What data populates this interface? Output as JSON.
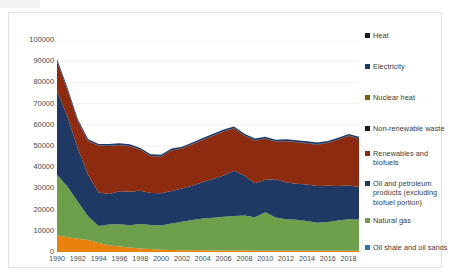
{
  "chart_data": {
    "type": "area",
    "stacked": true,
    "title": "",
    "subtitle": "",
    "xlabel": "",
    "ylabel": "",
    "grid": true,
    "legend_position": "right",
    "xlim": [
      1990,
      2019
    ],
    "ylim": [
      0,
      100000
    ],
    "y_ticks": [
      "0",
      "10000",
      "20000",
      "30000",
      "40000",
      "50000",
      "60000",
      "70000",
      "80000",
      "90000",
      "100000"
    ],
    "x_ticks": [
      "1990",
      "1992",
      "1994",
      "1996",
      "1998",
      "2000",
      "2002",
      "2004",
      "2006",
      "2008",
      "2010",
      "2012",
      "2014",
      "2016",
      "2018"
    ],
    "x": [
      1990,
      1991,
      1992,
      1993,
      1994,
      1995,
      1996,
      1997,
      1998,
      1999,
      2000,
      2001,
      2002,
      2003,
      2004,
      2005,
      2006,
      2007,
      2008,
      2009,
      2010,
      2011,
      2012,
      2013,
      2014,
      2015,
      2016,
      2017,
      2018,
      2019
    ],
    "series": [
      {
        "name": "Oil shale and oil sands",
        "color": "#E8820C",
        "values": [
          7900,
          6900,
          6200,
          5700,
          4300,
          3200,
          2600,
          2100,
          1700,
          1400,
          1100,
          900,
          800,
          800,
          800,
          700,
          700,
          700,
          700,
          600,
          600,
          600,
          600,
          600,
          600,
          600,
          600,
          600,
          600,
          600
        ]
      },
      {
        "name": "Natural gas",
        "color": "#6E9F4B",
        "values": [
          28500,
          24000,
          17500,
          11000,
          8000,
          9800,
          10500,
          10500,
          11500,
          11300,
          11400,
          12600,
          13500,
          14300,
          15000,
          15400,
          15900,
          16300,
          16500,
          15800,
          18100,
          15700,
          14800,
          14600,
          14000,
          13200,
          13600,
          14200,
          14900,
          14700
        ]
      },
      {
        "name": "Oil and petroleum products (excluding biofuel portion)",
        "color": "#1F3864",
        "values": [
          39500,
          33000,
          25000,
          19500,
          15800,
          14400,
          15500,
          15800,
          15700,
          15100,
          15200,
          15300,
          15600,
          16200,
          17200,
          18300,
          19500,
          21300,
          18900,
          16000,
          15400,
          18000,
          17400,
          17000,
          17200,
          17300,
          17000,
          16300,
          15900,
          15400
        ]
      },
      {
        "name": "Renewables and biofuels",
        "color": "#8C2B10",
        "values": [
          13800,
          12500,
          12800,
          16000,
          22000,
          22600,
          21800,
          21500,
          19300,
          17400,
          17300,
          19100,
          18900,
          19400,
          19800,
          20400,
          20700,
          19900,
          18700,
          20100,
          19300,
          17700,
          19400,
          19500,
          19400,
          19500,
          20200,
          21800,
          23300,
          22700
        ]
      },
      {
        "name": "Non-renewable waste",
        "color": "#1A1A1A",
        "values": [
          100,
          100,
          100,
          100,
          100,
          100,
          100,
          100,
          100,
          100,
          100,
          100,
          100,
          200,
          200,
          200,
          200,
          200,
          200,
          200,
          200,
          200,
          200,
          200,
          200,
          200,
          200,
          200,
          200,
          200
        ]
      },
      {
        "name": "Nuclear heat",
        "color": "#7F6000",
        "values": [
          0,
          0,
          0,
          0,
          0,
          0,
          0,
          0,
          0,
          0,
          0,
          0,
          0,
          0,
          0,
          0,
          0,
          0,
          0,
          0,
          0,
          0,
          0,
          0,
          0,
          0,
          0,
          0,
          0,
          0
        ]
      },
      {
        "name": "Electricity",
        "color": "#1F3864",
        "values": [
          1200,
          1100,
          1000,
          900,
          800,
          800,
          800,
          800,
          800,
          800,
          800,
          800,
          800,
          800,
          800,
          800,
          800,
          800,
          800,
          800,
          800,
          800,
          800,
          800,
          800,
          800,
          800,
          800,
          800,
          800
        ]
      },
      {
        "name": "Heat",
        "color": "#1A1A1A",
        "values": [
          0,
          0,
          0,
          0,
          0,
          0,
          0,
          0,
          0,
          0,
          0,
          0,
          0,
          0,
          0,
          0,
          0,
          0,
          0,
          0,
          0,
          0,
          0,
          0,
          0,
          0,
          0,
          0,
          0,
          0
        ]
      }
    ],
    "totals": [
      91000,
      77600,
      62600,
      53200,
      51000,
      50900,
      51300,
      50800,
      49100,
      46200,
      45900,
      48800,
      49700,
      51700,
      54000,
      55800,
      57800,
      59200,
      56800,
      53500,
      54400,
      53000,
      53200,
      52700,
      52200,
      51600,
      52400,
      53900,
      55700,
      54400
    ]
  },
  "legend": {
    "items": [
      {
        "label": "Heat",
        "color": "#1A1A1A"
      },
      {
        "label": "Electricity",
        "color": "#1F3864"
      },
      {
        "label": "Nuclear heat",
        "color": "#7F6000"
      },
      {
        "label": "Non-renewable waste",
        "color": "#1A1A1A"
      },
      {
        "label": "Renewables and biofuels",
        "color": "#8C2B10"
      },
      {
        "label": "Oil and petroleum products (excluding biofuel portion)",
        "color": "#1F3864"
      },
      {
        "label": "Natural gas",
        "color": "#6E9F4B"
      },
      {
        "label": "Oil shale and oil sands",
        "color": "#2E74B5"
      }
    ]
  }
}
